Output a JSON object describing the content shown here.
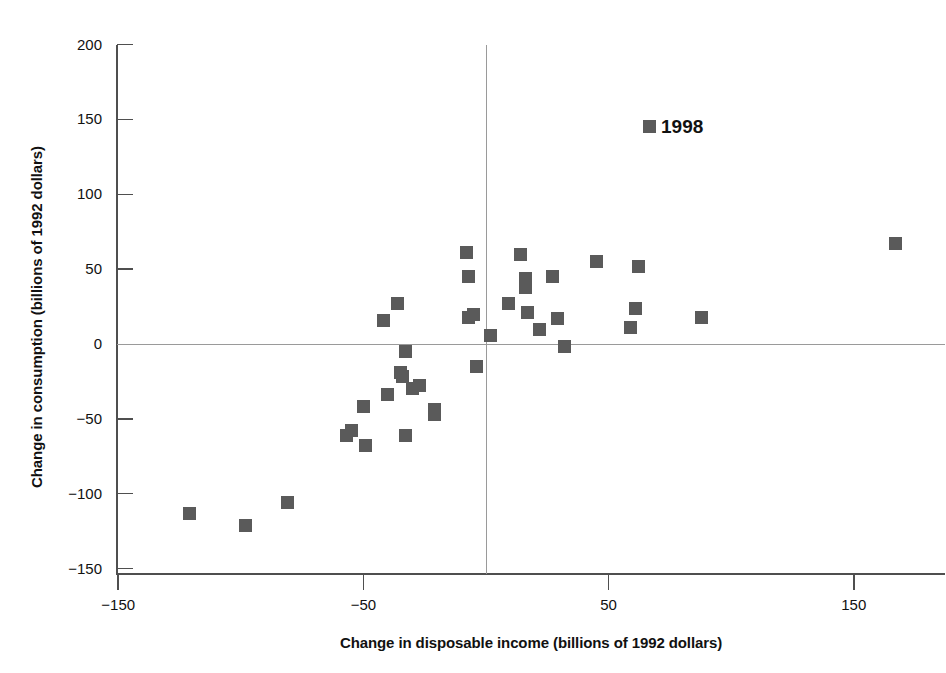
{
  "chart_data": {
    "type": "scatter",
    "title": "",
    "xlabel": "Change in disposable income (billions of 1992 dollars)",
    "ylabel": "Change in consumption (billions of 1992 dollars)",
    "xlim": [
      -150,
      160
    ],
    "ylim": [
      -150,
      200
    ],
    "xticks": [
      -150,
      -50,
      50,
      150
    ],
    "xtick_labels": [
      "−150",
      "−50",
      "50",
      "150"
    ],
    "yticks": [
      -150,
      -100,
      -50,
      0,
      50,
      100,
      150,
      200
    ],
    "ytick_labels": [
      "−150",
      "−100",
      "−50",
      "0",
      "50",
      "100",
      "150",
      "200"
    ],
    "grid": false,
    "reference_lines": {
      "horizontal": 0,
      "vertical": 0
    },
    "legend": {
      "position": "upper-center-right",
      "entries": [
        "1998"
      ]
    },
    "series": [
      {
        "name": "1998",
        "marker": "square",
        "color": "#5a5a5a",
        "points": [
          {
            "x": -121,
            "y": -113
          },
          {
            "x": -98,
            "y": -121
          },
          {
            "x": -81,
            "y": -106
          },
          {
            "x": -57,
            "y": -61
          },
          {
            "x": -55,
            "y": -58
          },
          {
            "x": -50,
            "y": -42
          },
          {
            "x": -49,
            "y": -68
          },
          {
            "x": -42,
            "y": 16
          },
          {
            "x": -40,
            "y": -34
          },
          {
            "x": -36,
            "y": 27
          },
          {
            "x": -35,
            "y": -19
          },
          {
            "x": -34,
            "y": -22
          },
          {
            "x": -33,
            "y": -5
          },
          {
            "x": -33,
            "y": -61
          },
          {
            "x": -30,
            "y": -30
          },
          {
            "x": -27,
            "y": -28
          },
          {
            "x": -21,
            "y": -44
          },
          {
            "x": -21,
            "y": -47
          },
          {
            "x": -8,
            "y": 61
          },
          {
            "x": -7,
            "y": 45
          },
          {
            "x": -7,
            "y": 18
          },
          {
            "x": -5,
            "y": 20
          },
          {
            "x": -4,
            "y": -15
          },
          {
            "x": 2,
            "y": 6
          },
          {
            "x": 9,
            "y": 27
          },
          {
            "x": 14,
            "y": 60
          },
          {
            "x": 16,
            "y": 44
          },
          {
            "x": 16,
            "y": 38
          },
          {
            "x": 17,
            "y": 21
          },
          {
            "x": 22,
            "y": 10
          },
          {
            "x": 27,
            "y": 45
          },
          {
            "x": 29,
            "y": 17
          },
          {
            "x": 32,
            "y": -2
          },
          {
            "x": 45,
            "y": 55
          },
          {
            "x": 62,
            "y": 52
          },
          {
            "x": 61,
            "y": 24
          },
          {
            "x": 59,
            "y": 11
          },
          {
            "x": 88,
            "y": 18
          },
          {
            "x": 167,
            "y": 67
          }
        ]
      }
    ]
  },
  "legend": {
    "label": "1998",
    "swatch_color": "#5a5a5a"
  },
  "axes": {
    "x_title": "Change in disposable income (billions of 1992 dollars)",
    "y_title": "Change in consumption (billions of 1992 dollars)"
  }
}
